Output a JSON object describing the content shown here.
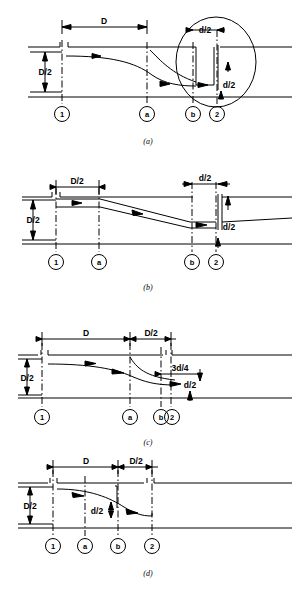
{
  "figure": {
    "line_color": "#000000",
    "background": "#ffffff",
    "panels": [
      {
        "id": "a",
        "caption": "(a)",
        "dimensions": [
          {
            "label": "D",
            "name": "dim-D"
          },
          {
            "label": "D/2",
            "name": "dim-D-half-vertical"
          },
          {
            "label": "d/2",
            "name": "dim-d-half-horizontal"
          },
          {
            "label": "d/2",
            "name": "dim-d-half-vertical"
          }
        ],
        "stations": [
          "1",
          "a",
          "b",
          "2"
        ],
        "detail_circle": true
      },
      {
        "id": "b",
        "caption": "(b)",
        "dimensions": [
          {
            "label": "D/2",
            "name": "dim-D-half-horizontal"
          },
          {
            "label": "D/2",
            "name": "dim-D-half-vertical"
          },
          {
            "label": "d/2",
            "name": "dim-d-half-horizontal"
          },
          {
            "label": "d/2",
            "name": "dim-d-half-vertical"
          }
        ],
        "stations": [
          "1",
          "a",
          "b",
          "2"
        ],
        "detail_circle": false
      },
      {
        "id": "c",
        "caption": "(c)",
        "dimensions": [
          {
            "label": "D",
            "name": "dim-D"
          },
          {
            "label": "D/2",
            "name": "dim-D-half-horizontal"
          },
          {
            "label": "D/2",
            "name": "dim-D-half-vertical"
          },
          {
            "label": "3d/4",
            "name": "dim-3d-quarter"
          },
          {
            "label": "d/2",
            "name": "dim-d-half-vertical"
          }
        ],
        "stations": [
          "1",
          "a",
          "b",
          "2"
        ],
        "detail_circle": false
      },
      {
        "id": "d",
        "caption": "(d)",
        "dimensions": [
          {
            "label": "D",
            "name": "dim-D"
          },
          {
            "label": "D/2",
            "name": "dim-D-half-horizontal"
          },
          {
            "label": "D/2",
            "name": "dim-D-half-vertical"
          },
          {
            "label": "d/2",
            "name": "dim-d-half-vertical"
          }
        ],
        "stations": [
          "1",
          "a",
          "b",
          "2"
        ],
        "detail_circle": false
      }
    ]
  },
  "labels": {
    "D": "D",
    "D_half": "D/2",
    "d_half": "d/2",
    "three_d_quarter": "3d/4",
    "station_1": "1",
    "station_a": "a",
    "station_b": "b",
    "station_2": "2",
    "caption_a": "(a)",
    "caption_b": "(b)",
    "caption_c": "(c)",
    "caption_d": "(d)"
  }
}
